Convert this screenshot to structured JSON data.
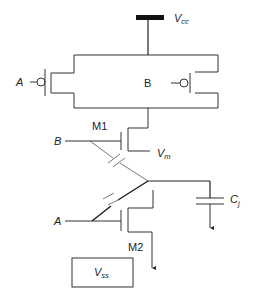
{
  "diagram": {
    "type": "circuit-schematic",
    "colors": {
      "wire": "#333333",
      "thick_wire": "#1a1a1a",
      "background": "#ffffff",
      "supply_bar": "#111111"
    },
    "supply": {
      "label": "V",
      "subscript": "cc"
    },
    "ground_box": {
      "label": "V",
      "subscript": "ss"
    },
    "pmos_left": {
      "gate_label": "A"
    },
    "pmos_right": {
      "gate_label": "B"
    },
    "nmos_top": {
      "name": "M1",
      "gate_label": "B"
    },
    "nmos_bottom": {
      "name": "M2",
      "gate_label": "A"
    },
    "output": {
      "label": "V",
      "subscript": "m"
    },
    "load_capacitor": {
      "label": "C",
      "subscript": "j"
    }
  }
}
